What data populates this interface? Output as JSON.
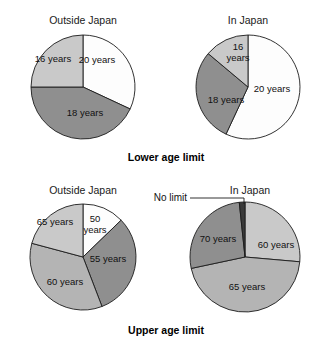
{
  "figure": {
    "width": 331,
    "height": 344,
    "background": "#ffffff"
  },
  "colors": {
    "white": "#fdfdfd",
    "light_gray": "#c9c9c9",
    "medium_gray": "#b4b4b4",
    "dark_gray": "#8f8f8f",
    "very_dark": "#3a3a3a",
    "outline": "#1c1c1c",
    "text": "#111111"
  },
  "captions": {
    "lower": "Lower age limit",
    "upper": "Upper age limit"
  },
  "panel_titles": {
    "outside_japan": "Outside Japan",
    "in_japan": "In Japan"
  },
  "callouts": {
    "no_limit": "No limit"
  },
  "chart_data": [
    {
      "type": "pie",
      "id": "lower-outside-japan",
      "title": "Outside Japan",
      "group": "Lower age limit",
      "center": [
        83,
        87
      ],
      "radius": 52,
      "start_angle_deg": 0,
      "labels": [
        "20 years",
        "18 years",
        "16 years"
      ],
      "values": [
        32,
        43,
        25
      ],
      "angles_deg": [
        115,
        155,
        90
      ],
      "colors": [
        "#fdfdfd",
        "#8f8f8f",
        "#c9c9c9"
      ],
      "label_positions": [
        [
          97,
          63
        ],
        [
          85,
          116
        ],
        [
          53,
          62
        ]
      ]
    },
    {
      "type": "pie",
      "id": "lower-in-japan",
      "title": "In Japan",
      "group": "Lower age limit",
      "center": [
        248,
        87
      ],
      "radius": 52,
      "start_angle_deg": 0,
      "labels": [
        "20 years",
        "18 years",
        "16 years"
      ],
      "values": [
        57,
        29,
        14
      ],
      "angles_deg": [
        205,
        105,
        50
      ],
      "colors": [
        "#fdfdfd",
        "#8f8f8f",
        "#c9c9c9"
      ],
      "label_positions": [
        [
          272,
          92
        ],
        [
          226,
          103
        ],
        [
          238,
          50
        ]
      ]
    },
    {
      "type": "pie",
      "id": "upper-outside-japan",
      "title": "Outside Japan",
      "group": "Upper age limit",
      "center": [
        83,
        257
      ],
      "radius": 53,
      "start_angle_deg": 0,
      "labels": [
        "50 years",
        "55 years",
        "60 years",
        "65 years"
      ],
      "values": [
        13,
        31,
        35,
        21
      ],
      "angles_deg": [
        46,
        113,
        126,
        75
      ],
      "colors": [
        "#fdfdfd",
        "#8f8f8f",
        "#b4b4b4",
        "#c9c9c9"
      ],
      "label_positions": [
        [
          95,
          222
        ],
        [
          108,
          262
        ],
        [
          65,
          285
        ],
        [
          55,
          225
        ]
      ]
    },
    {
      "type": "pie",
      "id": "upper-in-japan",
      "title": "In Japan",
      "group": "Upper age limit",
      "center": [
        245,
        257
      ],
      "radius": 55,
      "start_angle_deg": 0,
      "labels": [
        "60 years",
        "65 years",
        "70 years",
        "No limit"
      ],
      "values": [
        26,
        45,
        27,
        2
      ],
      "angles_deg": [
        95,
        163,
        96,
        6
      ],
      "colors": [
        "#c9c9c9",
        "#b4b4b4",
        "#8f8f8f",
        "#3a3a3a"
      ],
      "label_positions": [
        [
          276,
          248
        ],
        [
          247,
          290
        ],
        [
          218,
          242
        ],
        [
          null,
          null
        ]
      ]
    }
  ],
  "annotations": {
    "no_limit_callout": {
      "text": "No limit",
      "text_x": 187,
      "text_y": 201,
      "line_x1": 190,
      "line_y1": 198,
      "line_x2": 244,
      "line_y2": 198,
      "line_x3": 244,
      "line_y3": 204
    }
  },
  "layout": {
    "title_y_top": 24,
    "title_y_bottom": 194,
    "caption_y_lower": 161,
    "caption_y_upper": 334,
    "title_x_left": 83,
    "title_x_right_top": 248,
    "title_x_right_bottom": 250,
    "caption_x": 166
  }
}
